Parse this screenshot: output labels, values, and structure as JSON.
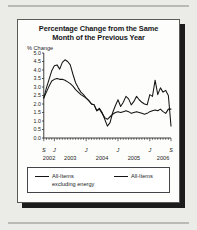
{
  "figure": {
    "title": "Percentage Change from the Same Month of the Previous Year",
    "title_line1": "Percentage Change from the Same",
    "title_line2": "Month of the Previous Year",
    "ylabel": "% Change",
    "legend": {
      "left_line1": "All-Items",
      "left_line2": "excluding energy",
      "right_line1": "All-Items"
    },
    "colors": {
      "line": "#141414",
      "axis": "#2a2a2a",
      "frame": "#5a5a57",
      "page_background": "#ebebe8",
      "panel_background": "#fdfdfc",
      "shadow": "#1c1c1c",
      "rule": "#b9b9b5"
    }
  },
  "chart_data": {
    "type": "line",
    "title": "Percentage Change from the Same Month of the Previous Year",
    "xlabel": "",
    "ylabel": "% Change",
    "ylim": [
      0.0,
      5.0
    ],
    "ytick_labels": [
      "5.0",
      "4.5",
      "4.0",
      "3.5",
      "3.0",
      "2.5",
      "2.0",
      "1.5",
      "1.0",
      "0.5",
      "0.0"
    ],
    "ytick_values": [
      5.0,
      4.5,
      4.0,
      3.5,
      3.0,
      2.5,
      2.0,
      1.5,
      1.0,
      0.5,
      0.0
    ],
    "grid": false,
    "legend_position": "below-axes",
    "x_major_tick_labels": [
      "S",
      "J",
      "J",
      "J",
      "J",
      "S"
    ],
    "x_major_tick_index": [
      0,
      4,
      16,
      28,
      40,
      48
    ],
    "x_year_labels": [
      "2002",
      "2003",
      "2004",
      "2005",
      "2006"
    ],
    "x_year_index": [
      2,
      10,
      22,
      34,
      45
    ],
    "x_minor_ticks": "monthly",
    "x_start": "2002-09",
    "x_end": "2006-09",
    "n_points": 49,
    "series": [
      {
        "name": "All-Items",
        "values": [
          2.35,
          2.95,
          3.45,
          3.95,
          4.25,
          4.3,
          4.05,
          4.45,
          4.6,
          4.5,
          4.3,
          3.75,
          3.25,
          2.95,
          2.7,
          2.55,
          2.35,
          2.2,
          2.0,
          1.95,
          1.6,
          1.75,
          1.5,
          1.1,
          0.7,
          0.9,
          1.5,
          1.9,
          2.25,
          1.85,
          2.1,
          2.45,
          2.3,
          1.95,
          2.15,
          2.45,
          2.25,
          2.1,
          2.0,
          1.95,
          2.55,
          2.45,
          3.4,
          2.55,
          2.95,
          2.7,
          2.8,
          2.5,
          0.7
        ]
      },
      {
        "name": "All-Items excluding energy",
        "values": [
          2.35,
          2.7,
          3.05,
          3.35,
          3.45,
          3.5,
          3.45,
          3.45,
          3.4,
          3.3,
          3.2,
          3.05,
          2.85,
          2.7,
          2.55,
          2.45,
          2.35,
          2.2,
          2.0,
          1.95,
          1.6,
          1.7,
          1.45,
          1.2,
          1.1,
          1.25,
          1.4,
          1.5,
          1.55,
          1.5,
          1.55,
          1.6,
          1.55,
          1.45,
          1.5,
          1.55,
          1.5,
          1.45,
          1.4,
          1.45,
          1.55,
          1.6,
          1.65,
          1.6,
          1.7,
          1.55,
          1.45,
          1.7,
          1.7
        ]
      }
    ]
  }
}
